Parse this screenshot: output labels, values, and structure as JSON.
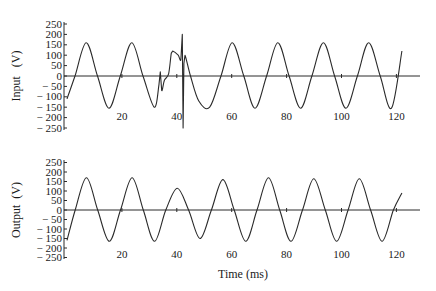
{
  "chart_data": [
    {
      "type": "line",
      "title": "",
      "xlabel": "",
      "ylabel": "Input (V)",
      "ylim": [
        -250,
        250
      ],
      "xlim": [
        0,
        125
      ],
      "yticks": [
        250,
        200,
        150,
        100,
        50,
        0,
        -50,
        -100,
        -150,
        -200,
        -250
      ],
      "xticks": [
        20,
        40,
        60,
        80,
        100,
        120
      ],
      "grid": false,
      "series": [
        {
          "name": "Input",
          "description": "60 Hz sine ~160 V peak with a transient disturbance around 33-44 ms (dip, step to ~120 V, sharp spike to ~+200 V / -250 V at ~42 ms)",
          "x": [
            0,
            2.9,
            7.0,
            11.1,
            15.3,
            19.4,
            23.6,
            27.7,
            31.8,
            33.5,
            34.0,
            34.5,
            35.5,
            37.0,
            38.0,
            38.5,
            40.5,
            41.5,
            42.0,
            42.3,
            42.6,
            43.0,
            45.0,
            48.0,
            52.0,
            56.1,
            60.2,
            64.4,
            68.5,
            72.7,
            76.8,
            80.9,
            85.1,
            89.2,
            93.4,
            97.5,
            101.6,
            105.8,
            109.9,
            114.1,
            118.2,
            122.0
          ],
          "values": [
            -110,
            0,
            160,
            0,
            -155,
            0,
            160,
            0,
            -150,
            -40,
            20,
            -70,
            -20,
            10,
            110,
            120,
            100,
            80,
            200,
            -250,
            60,
            100,
            0,
            -120,
            -150,
            0,
            160,
            0,
            -155,
            0,
            160,
            0,
            -155,
            0,
            160,
            0,
            -155,
            0,
            160,
            0,
            -155,
            120
          ]
        }
      ]
    },
    {
      "type": "line",
      "title": "",
      "xlabel": "Time (ms)",
      "ylabel": "Output (V)",
      "ylim": [
        -250,
        250
      ],
      "xlim": [
        0,
        125
      ],
      "yticks": [
        250,
        200,
        150,
        100,
        50,
        0,
        -50,
        -100,
        -150,
        -200,
        -250
      ],
      "xticks": [
        20,
        40,
        60,
        80,
        100,
        120
      ],
      "grid": false,
      "series": [
        {
          "name": "Output",
          "description": "Regulated ~60 Hz sine ~170 V peak; reduced third peak (~115 V) during the input disturbance",
          "x": [
            0,
            3.0,
            7.1,
            11.2,
            15.4,
            19.5,
            23.7,
            27.8,
            31.9,
            36.0,
            40.2,
            44.3,
            48.5,
            52.6,
            56.8,
            60.9,
            65.1,
            69.2,
            73.4,
            77.5,
            81.6,
            85.8,
            89.9,
            94.1,
            98.2,
            102.4,
            106.5,
            110.6,
            114.8,
            118.9,
            122.0
          ],
          "values": [
            -160,
            0,
            170,
            0,
            -165,
            0,
            170,
            0,
            -165,
            0,
            115,
            0,
            -150,
            0,
            160,
            0,
            -165,
            0,
            170,
            0,
            -165,
            0,
            165,
            0,
            -165,
            0,
            165,
            0,
            -165,
            0,
            90
          ]
        }
      ]
    }
  ],
  "panels": {
    "top": {
      "ylabel": "Input   (V)"
    },
    "bottom": {
      "ylabel": "Output  (V)",
      "xlabel": "Time (ms)"
    }
  },
  "ytick_labels": [
    "250",
    "200",
    "150",
    "100",
    "50",
    "0",
    "− 50",
    "− 100",
    "− 150",
    "− 200",
    "− 250"
  ],
  "xtick_labels": [
    "20",
    "40",
    "60",
    "80",
    "100",
    "120"
  ]
}
